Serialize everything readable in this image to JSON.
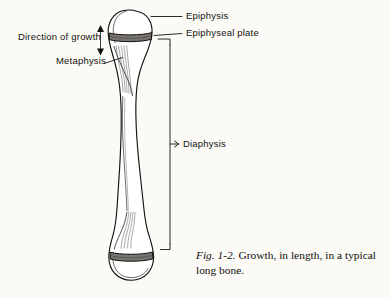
{
  "figure": {
    "background_color": "#fbfaf7",
    "ink_color": "#15130f",
    "plate_fill_color": "#777471",
    "bone_fill_color": "#ffffff"
  },
  "labels": {
    "epiphysis": "Epiphysis",
    "epiphyseal_plate": "Epiphyseal plate",
    "metaphysis": "Metaphysis",
    "direction_of_growth": "Direction of growth",
    "diaphysis": "Diaphysis"
  },
  "caption": {
    "figure_number": "Fig. 1-2.",
    "text": " Growth, in length, in a typical long bone."
  },
  "anatomy_parts": [
    {
      "name": "epiphysis",
      "description": "rounded bone end, proximal and distal"
    },
    {
      "name": "epiphyseal plate",
      "description": "dark transverse growth band"
    },
    {
      "name": "metaphysis",
      "description": "flared region below the growth plate"
    },
    {
      "name": "diaphysis",
      "description": "narrow central shaft"
    }
  ]
}
